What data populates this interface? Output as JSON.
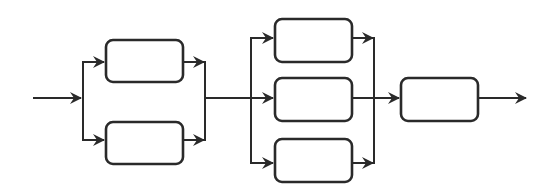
{
  "diagram": {
    "type": "block-flow",
    "colors": {
      "stroke": "#2a2a2a",
      "background": "#ffffff"
    },
    "stages": [
      {
        "name": "stage-1",
        "parallel_blocks": 2,
        "labels": [
          "",
          ""
        ]
      },
      {
        "name": "stage-2",
        "parallel_blocks": 3,
        "labels": [
          "",
          "",
          ""
        ]
      },
      {
        "name": "stage-3",
        "parallel_blocks": 1,
        "labels": [
          ""
        ]
      }
    ],
    "input_arrow": true,
    "output_arrow": true
  }
}
